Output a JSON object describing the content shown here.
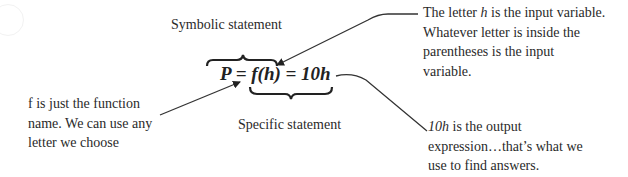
{
  "diagram": {
    "symbolic_label": "Symbolic statement",
    "specific_label": "Specific statement",
    "equation": "P = f(h) = 10h",
    "notes": {
      "input_variable": [
        {
          "text_parts": [
            "The letter ",
            "h",
            " is the input variable."
          ]
        },
        "Whatever letter is inside the",
        "parentheses is the input",
        "variable."
      ],
      "function_name": [
        "f is just the function",
        "name.  We can use any",
        "letter we choose"
      ],
      "output_expression": [
        {
          "text_parts": [
            "10h",
            " is the output"
          ]
        },
        "expression…that’s what we",
        "use to find answers."
      ]
    },
    "line1_a": "The letter ",
    "line1_b": "h",
    "line1_c": " is the input variable.",
    "line2": "Whatever letter is inside the",
    "line3": "parentheses is the input",
    "line4": "variable.",
    "f_line1": "f is just the function",
    "f_line2": "name.  We can use any",
    "f_line3": "letter we choose",
    "o_line1_a": "10h",
    "o_line1_b": " is the output",
    "o_line2": "expression…that’s what we",
    "o_line3": "use to find answers.",
    "colors": {
      "text": "#2a2a2a",
      "lines": "#333333",
      "background": "#ffffff"
    }
  }
}
